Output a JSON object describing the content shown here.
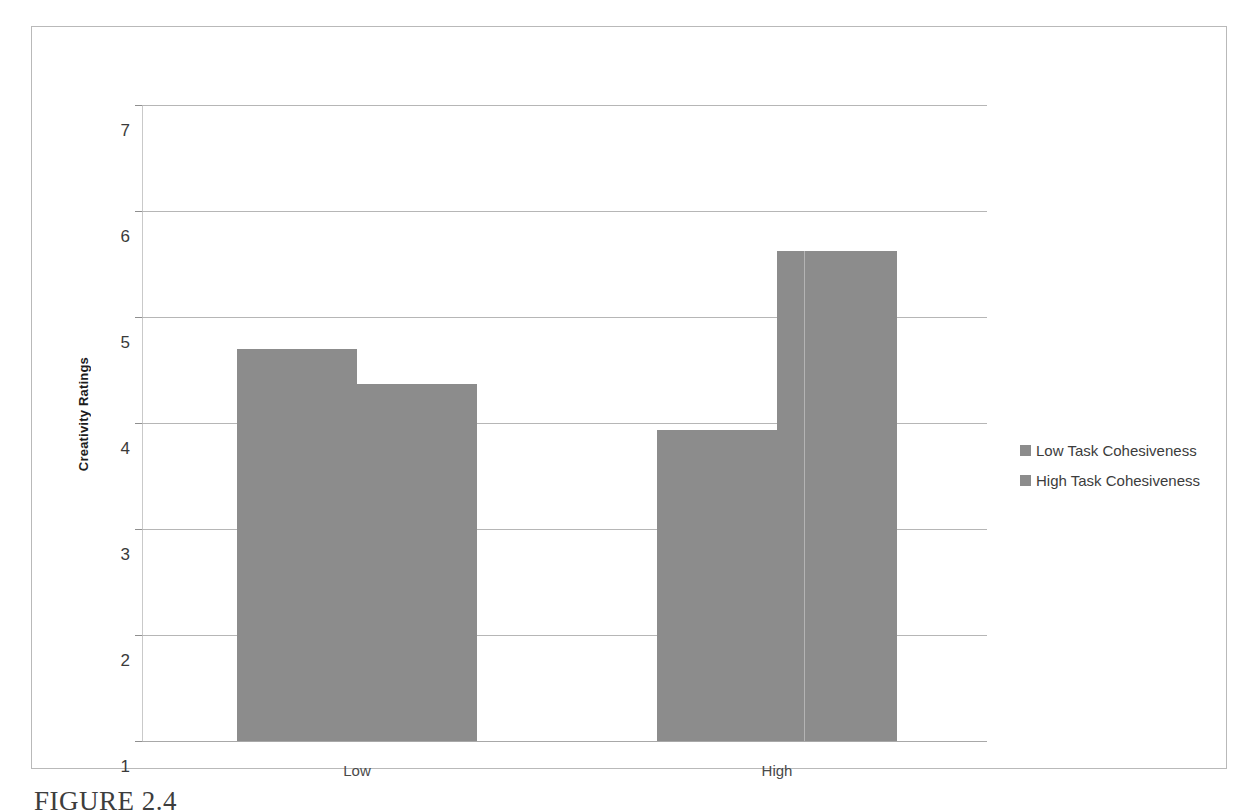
{
  "figure": {
    "caption": "FIGURE 2.4"
  },
  "chart_data": {
    "type": "bar",
    "title": "",
    "xlabel": "",
    "ylabel": "Creativity Ratings",
    "categories": [
      "Low",
      "High"
    ],
    "series": [
      {
        "name": "Low Task Cohesiveness",
        "values": [
          4.7,
          3.93
        ],
        "color": "#8c8c8c"
      },
      {
        "name": "High Task Cohesiveness",
        "values": [
          4.37,
          5.62
        ],
        "color": "#8c8c8c"
      }
    ],
    "ylim": [
      1,
      7
    ],
    "yticks": [
      7,
      6,
      5,
      4,
      3,
      2,
      1
    ],
    "ytick_labels": [
      "7",
      "6",
      "5",
      "4",
      "3",
      "2",
      "1"
    ],
    "grid": true,
    "legend_position": "right",
    "bar_gap": "none"
  },
  "colors": {
    "bar_fill": "#8c8c8c",
    "gridline": "#b6b6b6",
    "frame": "#b9b9b9",
    "axis_text": "#3a3a3a"
  }
}
